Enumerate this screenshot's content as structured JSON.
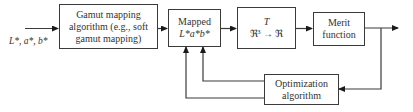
{
  "diagram": {
    "input_label": "L*, a*, b*",
    "nodes": [
      {
        "id": "gamut",
        "lines": [
          "Gamut mapping",
          "algorithm (e.g., soft",
          "gamut mapping)"
        ]
      },
      {
        "id": "mapped",
        "lines": [
          "Mapped",
          "L*a*b*"
        ]
      },
      {
        "id": "transform",
        "lines": [
          "T",
          "ℜ³ → ℜ"
        ]
      },
      {
        "id": "merit",
        "lines": [
          "Merit",
          "function"
        ]
      },
      {
        "id": "optimization",
        "lines": [
          "Optimization",
          "algorithm"
        ]
      }
    ],
    "edges": [
      {
        "from": "input",
        "to": "gamut"
      },
      {
        "from": "gamut",
        "to": "mapped"
      },
      {
        "from": "mapped",
        "to": "transform"
      },
      {
        "from": "transform",
        "to": "merit"
      },
      {
        "from": "merit",
        "to": "output"
      },
      {
        "from": "merit",
        "to": "optimization"
      },
      {
        "from": "optimization",
        "to": "mapped"
      },
      {
        "from": "optimization",
        "to": "mapped"
      }
    ],
    "colors": {
      "stroke": "#3a3a3a",
      "background": "#ffffff",
      "text": "#333333"
    }
  }
}
